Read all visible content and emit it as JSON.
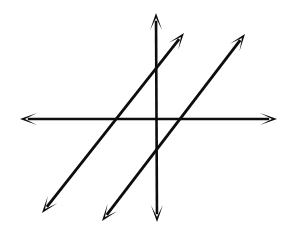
{
  "figure": {
    "background_color": "#ffffff",
    "ink_color": "#0d0d0d",
    "width": 297,
    "height": 234
  },
  "chart_data": {
    "type": "line",
    "title": "",
    "xlabel": "",
    "ylabel": "",
    "grid": false,
    "legend": false,
    "axis_style": "double-headed arrows, hand drawn",
    "origin_px": {
      "x": 156,
      "y": 119
    },
    "axes": [
      {
        "name": "x-axis",
        "orientation": "horizontal",
        "start_px": {
          "x": 20,
          "y": 119
        },
        "end_px": {
          "x": 277,
          "y": 119
        },
        "arrow_start": true,
        "arrow_end": true,
        "stroke_width": 2.4
      },
      {
        "name": "y-axis",
        "orientation": "vertical",
        "start_px": {
          "x": 156,
          "y": 13
        },
        "end_px": {
          "x": 157,
          "y": 222
        },
        "arrow_start": true,
        "arrow_end": true,
        "stroke_width": 2.6
      }
    ],
    "series": [
      {
        "name": "line-1",
        "label": "",
        "start_px": {
          "x": 42,
          "y": 213
        },
        "end_px": {
          "x": 184,
          "y": 33
        },
        "arrow_start": true,
        "arrow_end": true,
        "stroke_width": 2.8,
        "slope": -1.268,
        "x_intercept_px": 118,
        "y_intercept_px": 75
      },
      {
        "name": "line-2",
        "label": "",
        "start_px": {
          "x": 102,
          "y": 221
        },
        "end_px": {
          "x": 245,
          "y": 34
        },
        "arrow_start": true,
        "arrow_end": true,
        "stroke_width": 2.8,
        "slope": -1.308,
        "x_intercept_px": 182,
        "y_intercept_px": 158
      }
    ],
    "annotations": [],
    "relationship": "the two slanted lines are parallel"
  }
}
